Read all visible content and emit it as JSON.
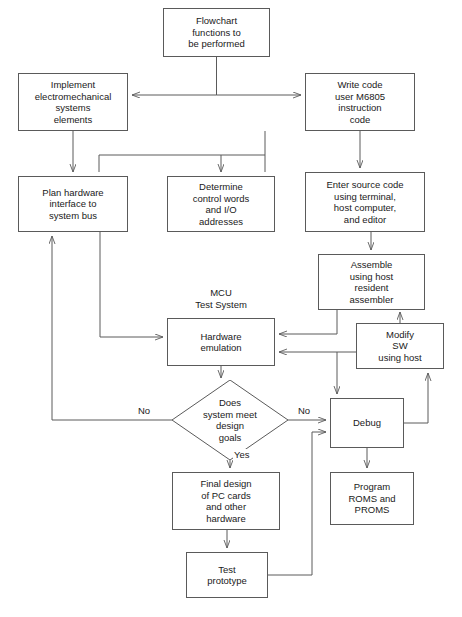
{
  "diagram": {
    "type": "flowchart",
    "colors": {
      "line": "#5a5a5a",
      "text": "#1a1a1a",
      "background": "#ffffff"
    },
    "nodes": [
      {
        "id": "flowchart-functions",
        "shape": "rect",
        "label": "Flowchart\nfunctions to\nbe performed",
        "x": 163,
        "y": 8,
        "w": 107,
        "h": 49
      },
      {
        "id": "implement-electromechanical",
        "shape": "rect",
        "label": "Implement\nelectromechanical\nsystems\nelements",
        "x": 18,
        "y": 73,
        "w": 110,
        "h": 58
      },
      {
        "id": "write-code",
        "shape": "rect",
        "label": "Write code\nuser M6805\ninstruction\ncode",
        "x": 305,
        "y": 73,
        "w": 110,
        "h": 58
      },
      {
        "id": "plan-hardware",
        "shape": "rect",
        "label": "Plan hardware\ninterface to\nsystem bus",
        "x": 18,
        "y": 176,
        "w": 110,
        "h": 56
      },
      {
        "id": "determine-control-words",
        "shape": "rect",
        "label": "Determine\ncontrol words\nand I/O\naddresses",
        "x": 167,
        "y": 176,
        "w": 108,
        "h": 56
      },
      {
        "id": "enter-source-code",
        "shape": "rect",
        "label": "Enter source code\nusing terminal,\nhost computer,\nand editor",
        "x": 305,
        "y": 172,
        "w": 120,
        "h": 60
      },
      {
        "id": "assemble-using-host",
        "shape": "rect",
        "label": "Assemble\nusing host\nresident\nassembler",
        "x": 318,
        "y": 254,
        "w": 107,
        "h": 56
      },
      {
        "id": "hardware-emulation",
        "shape": "rect",
        "label": "Hardware\nemulation",
        "x": 167,
        "y": 318,
        "w": 108,
        "h": 48
      },
      {
        "id": "modify-sw",
        "shape": "rect",
        "label": "Modify\nSW\nusing host",
        "x": 356,
        "y": 323,
        "w": 88,
        "h": 46
      },
      {
        "id": "does-system-meet-design-goals",
        "shape": "diamond",
        "label": "Does\nsystem meet\ndesign\ngoals",
        "x": 172,
        "y": 380,
        "w": 116,
        "h": 80
      },
      {
        "id": "debug",
        "shape": "rect",
        "label": "Debug",
        "x": 330,
        "y": 398,
        "w": 74,
        "h": 50
      },
      {
        "id": "final-design-pc-cards",
        "shape": "rect",
        "label": "Final design\nof PC cards\nand other\nhardware",
        "x": 172,
        "y": 472,
        "w": 108,
        "h": 58
      },
      {
        "id": "program-roms-proms",
        "shape": "rect",
        "label": "Program\nROMS and\nPROMS",
        "x": 330,
        "y": 472,
        "w": 84,
        "h": 53
      },
      {
        "id": "test-prototype",
        "shape": "rect",
        "label": "Test\nprototype",
        "x": 186,
        "y": 552,
        "w": 82,
        "h": 46
      }
    ],
    "floating_labels": [
      {
        "id": "mcu-test-system",
        "text": "MCU\nTest System",
        "x": 176,
        "y": 287,
        "w": 90
      }
    ],
    "edge_labels": [
      {
        "id": "no-left",
        "text": "No",
        "x": 137,
        "y": 405
      },
      {
        "id": "no-right",
        "text": "No",
        "x": 297,
        "y": 405
      },
      {
        "id": "yes-down",
        "text": "Yes",
        "x": 233,
        "y": 449
      }
    ]
  }
}
